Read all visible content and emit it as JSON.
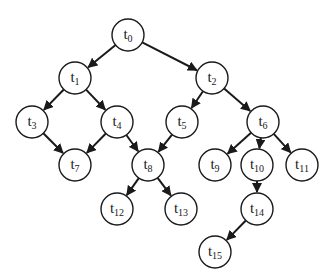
{
  "diagram": {
    "type": "directed-tree",
    "node_radius": 16,
    "colors": {
      "stroke": "#1a1a1a",
      "fill": "#ffffff",
      "background": "#ffffff"
    },
    "nodes": [
      {
        "id": "t0",
        "base": "t",
        "sub": "0",
        "x": 128,
        "y": 35
      },
      {
        "id": "t1",
        "base": "t",
        "sub": "1",
        "x": 75,
        "y": 78
      },
      {
        "id": "t2",
        "base": "t",
        "sub": "2",
        "x": 212,
        "y": 78
      },
      {
        "id": "t3",
        "base": "t",
        "sub": "3",
        "x": 32,
        "y": 122
      },
      {
        "id": "t4",
        "base": "t",
        "sub": "4",
        "x": 117,
        "y": 122
      },
      {
        "id": "t5",
        "base": "t",
        "sub": "5",
        "x": 182,
        "y": 122
      },
      {
        "id": "t6",
        "base": "t",
        "sub": "6",
        "x": 263,
        "y": 122
      },
      {
        "id": "t7",
        "base": "t",
        "sub": "7",
        "x": 75,
        "y": 165
      },
      {
        "id": "t8",
        "base": "t",
        "sub": "8",
        "x": 148,
        "y": 165
      },
      {
        "id": "t9",
        "base": "t",
        "sub": "9",
        "x": 215,
        "y": 165
      },
      {
        "id": "t10",
        "base": "t",
        "sub": "10",
        "x": 257,
        "y": 165
      },
      {
        "id": "t11",
        "base": "t",
        "sub": "11",
        "x": 302,
        "y": 165
      },
      {
        "id": "t12",
        "base": "t",
        "sub": "12",
        "x": 117,
        "y": 209
      },
      {
        "id": "t13",
        "base": "t",
        "sub": "13",
        "x": 181,
        "y": 209
      },
      {
        "id": "t14",
        "base": "t",
        "sub": "14",
        "x": 257,
        "y": 209
      },
      {
        "id": "t15",
        "base": "t",
        "sub": "15",
        "x": 215,
        "y": 252
      }
    ],
    "edges": [
      {
        "from": "t0",
        "to": "t1"
      },
      {
        "from": "t0",
        "to": "t2"
      },
      {
        "from": "t1",
        "to": "t3"
      },
      {
        "from": "t1",
        "to": "t4"
      },
      {
        "from": "t2",
        "to": "t5"
      },
      {
        "from": "t2",
        "to": "t6"
      },
      {
        "from": "t3",
        "to": "t7"
      },
      {
        "from": "t4",
        "to": "t7"
      },
      {
        "from": "t4",
        "to": "t8"
      },
      {
        "from": "t5",
        "to": "t8"
      },
      {
        "from": "t6",
        "to": "t9"
      },
      {
        "from": "t6",
        "to": "t10"
      },
      {
        "from": "t6",
        "to": "t11"
      },
      {
        "from": "t8",
        "to": "t12"
      },
      {
        "from": "t8",
        "to": "t13"
      },
      {
        "from": "t10",
        "to": "t14"
      },
      {
        "from": "t14",
        "to": "t15"
      }
    ]
  }
}
